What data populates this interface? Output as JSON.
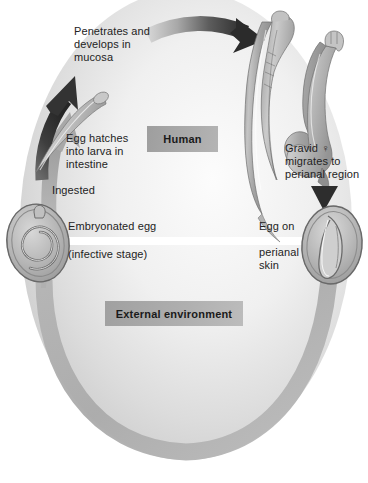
{
  "figure": {
    "background_color": "#ffffff"
  },
  "zones": {
    "human": {
      "label": "Human",
      "box_color": "#a8a8a8",
      "text_color": "#1a1a1a"
    },
    "external": {
      "label": "External environment",
      "box_color": "#adadad",
      "text_color": "#1a1a1a"
    },
    "divider": {
      "name": "white-separator-band",
      "color": "#ffffff"
    }
  },
  "labels": {
    "penetrates": "Penetrates and\ndevelops in\nmucosa",
    "egg_hatches": "Egg hatches\ninto larva in\nintestine",
    "ingested": "Ingested",
    "gravid": "Gravid ♀\nmigrates to\nperianal region",
    "embryonated_egg": "Embryonated egg",
    "infective_stage": "(infective stage)",
    "egg_on": "Egg on",
    "perianal_skin": "perianal\nskin"
  },
  "organisms": {
    "embryonated_egg": {
      "name": "embryonated-egg-with-coiled-larva",
      "shell_color": "#b9b9b9",
      "outline_color": "#6e6e6e"
    },
    "perianal_egg": {
      "name": "egg-on-perianal-skin",
      "shell_color": "#bdbdbd",
      "outline_color": "#707070"
    },
    "larva": {
      "name": "hatched-larva",
      "color": "#b0b0b0"
    },
    "adult_female_worm": {
      "name": "gravid-female-pinworm",
      "color": "#a9a9a9"
    },
    "adult_worm_secondary": {
      "name": "adult-pinworm-curled",
      "color": "#aaaaaa"
    }
  },
  "arrows": {
    "top_migration": {
      "name": "arrow-larva-to-adult",
      "color_start": "#cfcfcf",
      "color_end": "#2b2b2b",
      "direction": "left-to-right"
    },
    "larva_up": {
      "name": "arrow-larva-penetrates-mucosa",
      "color": "#3a3a3a",
      "direction": "up-right"
    },
    "ingestion_up": {
      "name": "arrow-ingestion-to-intestine",
      "color": "#a3a3a3",
      "direction": "up"
    },
    "egg_deposit_down": {
      "name": "arrow-egg-deposited-on-perianal-skin",
      "color": "#2d2d2d",
      "direction": "down"
    },
    "external_cycle": {
      "name": "arrow-external-environment-cycle",
      "color": "#b0b0b0",
      "direction": "counter-clockwise"
    }
  },
  "colors": {
    "background_oval_light": "#fbfbfb",
    "background_oval_mid": "#e3e3e3",
    "background_oval_dark": "#c9c9c9",
    "label_text": "#232323"
  }
}
